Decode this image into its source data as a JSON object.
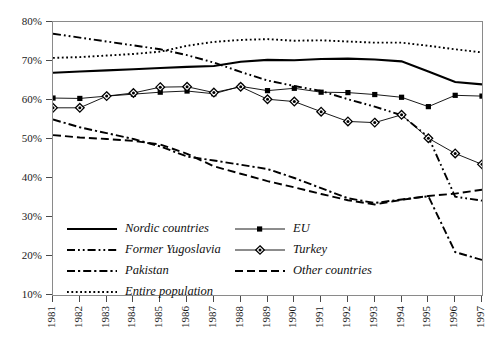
{
  "chart_data": {
    "type": "line",
    "title": "",
    "subtitle": "",
    "xlabel": "",
    "ylabel": "",
    "xlim": [
      1981,
      1997
    ],
    "ylim": [
      10,
      80
    ],
    "ytick_format": "percent",
    "grid": false,
    "legend_position": "inside-lower-left",
    "x": [
      1981,
      1982,
      1983,
      1984,
      1985,
      1986,
      1987,
      1988,
      1989,
      1990,
      1991,
      1992,
      1993,
      1994,
      1995,
      1996,
      1997
    ],
    "categories": [
      "1981",
      "1982",
      "1983",
      "1984",
      "1985",
      "1986",
      "1987",
      "1988",
      "1989",
      "1990",
      "1991",
      "1992",
      "1993",
      "1994",
      "1995",
      "1996",
      "1997"
    ],
    "yticks": [
      10,
      20,
      30,
      40,
      50,
      60,
      70,
      80
    ],
    "ytick_labels": [
      "10%",
      "20%",
      "30%",
      "40%",
      "50%",
      "60%",
      "70%",
      "80%"
    ],
    "series": [
      {
        "name": "Nordic countries",
        "style": "solid",
        "marker": "none",
        "color": "#000000",
        "values": [
          67.0,
          67.3,
          67.6,
          67.9,
          68.2,
          68.5,
          68.7,
          69.8,
          70.3,
          70.2,
          70.5,
          70.6,
          70.4,
          69.9,
          67.3,
          64.6,
          64.0
        ]
      },
      {
        "name": "EU",
        "style": "solid-thin",
        "marker": "square",
        "color": "#000000",
        "values": [
          60.5,
          60.4,
          61.0,
          61.5,
          62.0,
          62.3,
          61.6,
          63.5,
          62.4,
          63.0,
          62.0,
          61.9,
          61.4,
          60.7,
          58.3,
          61.2,
          61.0
        ]
      },
      {
        "name": "Former Yugoslavia",
        "style": "dash-dot-dot",
        "marker": "none",
        "color": "#000000",
        "values": [
          77.0,
          76.0,
          75.0,
          74.0,
          73.0,
          71.5,
          69.6,
          67.2,
          65.0,
          63.6,
          62.3,
          60.2,
          58.3,
          56.1,
          50.5,
          35.2,
          34.2
        ]
      },
      {
        "name": "Turkey",
        "style": "solid-thin",
        "marker": "diamond",
        "color": "#000000",
        "values": [
          58.0,
          58.0,
          61.0,
          61.8,
          63.3,
          63.4,
          61.9,
          63.4,
          60.2,
          59.6,
          57.0,
          54.5,
          54.2,
          56.2,
          50.2,
          46.3,
          43.5
        ]
      },
      {
        "name": "Pakistan",
        "style": "dash-dot",
        "marker": "none",
        "color": "#000000",
        "values": [
          55.0,
          53.0,
          51.5,
          50.0,
          48.1,
          45.5,
          44.5,
          43.4,
          42.3,
          40.0,
          37.4,
          34.8,
          33.6,
          34.5,
          35.3,
          21.0,
          19.0
        ]
      },
      {
        "name": "Other countries",
        "style": "dashed",
        "marker": "none",
        "color": "#000000",
        "values": [
          51.0,
          50.4,
          50.0,
          49.5,
          48.6,
          46.2,
          43.0,
          41.1,
          39.2,
          37.6,
          35.9,
          34.3,
          33.2,
          34.4,
          35.4,
          36.0,
          37.0
        ]
      },
      {
        "name": "Entire population",
        "style": "dotted",
        "marker": "none",
        "color": "#000000",
        "values": [
          70.8,
          71.0,
          71.4,
          71.8,
          72.4,
          73.9,
          74.9,
          75.4,
          75.6,
          75.2,
          75.3,
          75.0,
          74.7,
          74.7,
          73.9,
          73.0,
          72.2
        ]
      }
    ],
    "legend": [
      {
        "label": "Nordic countries",
        "style": "solid"
      },
      {
        "label": "EU",
        "style": "solid-thin",
        "marker": "square"
      },
      {
        "label": "Former Yugoslavia",
        "style": "dash-dot-dot"
      },
      {
        "label": "Turkey",
        "style": "solid-thin",
        "marker": "diamond"
      },
      {
        "label": "Pakistan",
        "style": "dash-dot"
      },
      {
        "label": "Other countries",
        "style": "dashed"
      },
      {
        "label": "Entire population",
        "style": "dotted"
      }
    ]
  },
  "legend_order": [
    {
      "label": "Nordic countries",
      "key": "nordic-countries"
    },
    {
      "label": "EU",
      "key": "eu"
    },
    {
      "label": "Former Yugoslavia",
      "key": "former-yugoslavia"
    },
    {
      "label": "Turkey",
      "key": "turkey"
    },
    {
      "label": "Pakistan",
      "key": "pakistan"
    },
    {
      "label": "Other countries",
      "key": "other-countries"
    },
    {
      "label": "Entire population",
      "key": "entire-population"
    }
  ]
}
